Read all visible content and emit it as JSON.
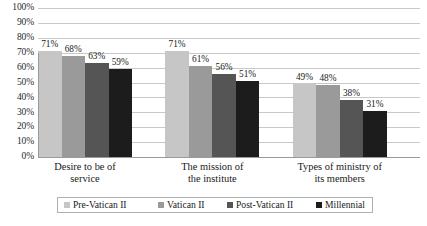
{
  "chart_data": {
    "type": "bar",
    "title": "",
    "subtitle": "",
    "xlabel": "",
    "ylabel": "",
    "ylim": [
      0,
      100
    ],
    "ytick_labels": [
      "100%",
      "90%",
      "80%",
      "70%",
      "60%",
      "50%",
      "40%",
      "30%",
      "20%",
      "10%",
      "0%"
    ],
    "ytick_values": [
      100,
      90,
      80,
      70,
      60,
      50,
      40,
      30,
      20,
      10,
      0
    ],
    "grid": true,
    "legend_position": "bottom",
    "value_suffix": "%",
    "categories": [
      "Desire to be of service",
      "The mission of the institute",
      "Types of ministry of its members"
    ],
    "category_lines": [
      [
        "Desire to be of",
        "service"
      ],
      [
        "The mission of",
        "the institute"
      ],
      [
        "Types of ministry of",
        "its members"
      ]
    ],
    "series": [
      {
        "name": "Pre-Vatican II",
        "color": "#c6c6c6",
        "values": [
          71,
          71,
          49
        ],
        "labels": [
          "71%",
          "71%",
          "49%"
        ]
      },
      {
        "name": "Vatican II",
        "color": "#9a9a9a",
        "values": [
          68,
          61,
          48
        ],
        "labels": [
          "68%",
          "61%",
          "48%"
        ]
      },
      {
        "name": "Post-Vatican II",
        "color": "#555555",
        "values": [
          63,
          56,
          38
        ],
        "labels": [
          "63%",
          "56%",
          "38%"
        ]
      },
      {
        "name": "Millennial",
        "color": "#1c1c1c",
        "values": [
          59,
          51,
          31
        ],
        "labels": [
          "59%",
          "51%",
          "31%"
        ]
      }
    ]
  }
}
